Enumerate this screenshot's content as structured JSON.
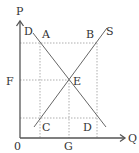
{
  "diagram": {
    "type": "supply-demand",
    "axes": {
      "y_label": "P",
      "x_label": "Q",
      "origin_label": "0"
    },
    "curves": {
      "demand_label": "D",
      "supply_label": "S"
    },
    "points": {
      "a": "A",
      "b": "B",
      "c": "C",
      "d": "D",
      "e": "E"
    },
    "axis_marks": {
      "f": "F",
      "g": "G"
    },
    "colors": {
      "axis": "#555555",
      "curve": "#666666",
      "guide": "#999999",
      "text": "#333333"
    }
  }
}
